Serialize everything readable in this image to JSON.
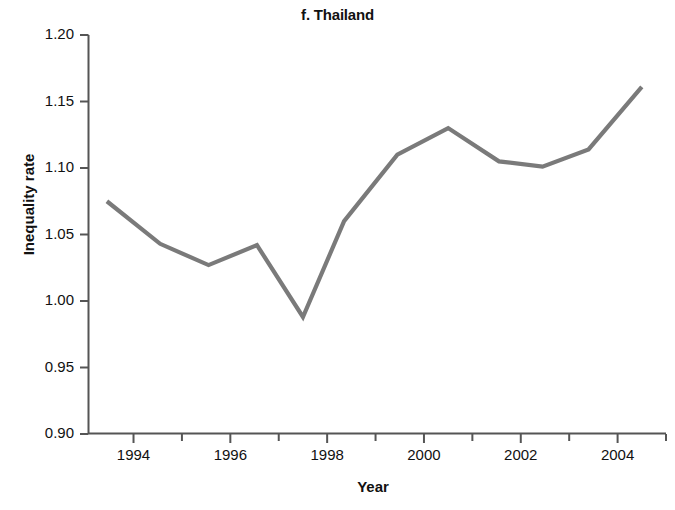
{
  "chart_data": {
    "type": "line",
    "title": "f. Thailand",
    "xlabel": "Year",
    "ylabel": "Inequality rate",
    "xlim": [
      1993.2,
      1994.9
    ],
    "ylim": [
      0.9,
      1.2
    ],
    "grid": false,
    "legend": null,
    "y_ticks": [
      "1.20",
      "1.15",
      "1.10",
      "1.05",
      "1.00",
      "0.95",
      "0.90"
    ],
    "y_tick_values": [
      1.2,
      1.15,
      1.1,
      1.05,
      1.0,
      0.95,
      0.9
    ],
    "x_ticks": [
      "1994",
      "1996",
      "1998",
      "2000",
      "2002",
      "2004"
    ],
    "x_tick_values": [
      1994,
      1996,
      1998,
      2000,
      2002,
      2004
    ],
    "x_minor_tick_values": [
      1993,
      1995,
      1997,
      1999,
      2001,
      2003,
      2005
    ],
    "series": [
      {
        "name": "Inequality rate",
        "color": "#7a7a7a",
        "x": [
          1993.45,
          1994.55,
          1995.55,
          1996.55,
          1997.5,
          1998.35,
          1999.45,
          2000.5,
          2001.55,
          2002.45,
          2003.4,
          2004.5
        ],
        "values": [
          1.075,
          1.043,
          1.027,
          1.042,
          0.988,
          1.06,
          1.11,
          1.13,
          1.105,
          1.101,
          1.114,
          1.161
        ]
      }
    ]
  },
  "axes": {
    "x_range": [
      1993.07,
      2005.0
    ],
    "y_range": [
      0.9,
      1.2
    ]
  }
}
